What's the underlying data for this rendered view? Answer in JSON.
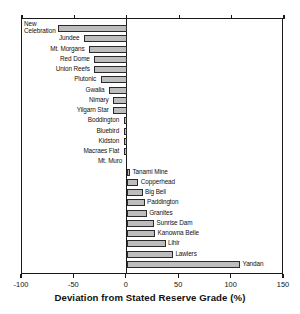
{
  "chart_data": {
    "type": "bar",
    "orientation": "horizontal",
    "title": "",
    "xlabel": "Deviation from Stated Reserve Grade (%)",
    "ylabel": "",
    "xlim": [
      -100,
      150
    ],
    "xticks": [
      -100,
      -50,
      0,
      50,
      100,
      150
    ],
    "xticklabels": [
      "-100",
      "-50",
      "0",
      "50",
      "100",
      "150"
    ],
    "grid": false,
    "legend": false,
    "bar_fill_color": "#bdbdbd",
    "bar_edge_color": "#2b2b2b",
    "categories": [
      "New Celebration",
      "Jundee",
      "Mt. Morgans",
      "Red Dome",
      "Union Reefs",
      "Plutonic",
      "Gwalia",
      "Nimary",
      "Yilgarn Star",
      "Boddington",
      "Bluebird",
      "Kidston",
      "Macraes Flat",
      "Mt. Muro",
      "Tanami Mine",
      "Copperhead",
      "Big Bell",
      "Paddington",
      "Granites",
      "Sunrise Dam",
      "Kanowna Belle",
      "Lihir",
      "Lawlers",
      "Yandan"
    ],
    "values": [
      -66,
      -41,
      -36,
      -31,
      -31,
      -25,
      -17,
      -13,
      -13,
      -3,
      -3,
      -3,
      -3,
      0,
      2,
      11,
      15,
      17,
      19,
      26,
      27,
      37,
      44,
      108
    ],
    "bars": [
      {
        "label": "New Celebration",
        "value": -66,
        "label_side": "left",
        "label_lines": [
          "New",
          "Celebration"
        ]
      },
      {
        "label": "Jundee",
        "value": -41,
        "label_side": "left"
      },
      {
        "label": "Mt. Morgans",
        "value": -36,
        "label_side": "left"
      },
      {
        "label": "Red Dome",
        "value": -31,
        "label_side": "left"
      },
      {
        "label": "Union Reefs",
        "value": -31,
        "label_side": "left"
      },
      {
        "label": "Plutonic",
        "value": -25,
        "label_side": "left"
      },
      {
        "label": "Gwalia",
        "value": -17,
        "label_side": "left"
      },
      {
        "label": "Nimary",
        "value": -13,
        "label_side": "left"
      },
      {
        "label": "Yilgarn Star",
        "value": -13,
        "label_side": "left"
      },
      {
        "label": "Boddington",
        "value": -3,
        "label_side": "left"
      },
      {
        "label": "Bluebird",
        "value": -3,
        "label_side": "left"
      },
      {
        "label": "Kidston",
        "value": -3,
        "label_side": "left"
      },
      {
        "label": "Macraes Flat",
        "value": -3,
        "label_side": "left"
      },
      {
        "label": "Mt. Muro",
        "value": 0,
        "label_side": "left"
      },
      {
        "label": "Tanami Mine",
        "value": 2,
        "label_side": "right"
      },
      {
        "label": "Copperhead",
        "value": 11,
        "label_side": "right"
      },
      {
        "label": "Big Bell",
        "value": 15,
        "label_side": "right"
      },
      {
        "label": "Paddington",
        "value": 17,
        "label_side": "right"
      },
      {
        "label": "Granites",
        "value": 19,
        "label_side": "right"
      },
      {
        "label": "Sunrise Dam",
        "value": 26,
        "label_side": "right"
      },
      {
        "label": "Kanowna Belle",
        "value": 27,
        "label_side": "right"
      },
      {
        "label": "Lihir",
        "value": 37,
        "label_side": "right"
      },
      {
        "label": "Lawlers",
        "value": 44,
        "label_side": "right"
      },
      {
        "label": "Yandan",
        "value": 108,
        "label_side": "right"
      }
    ]
  }
}
